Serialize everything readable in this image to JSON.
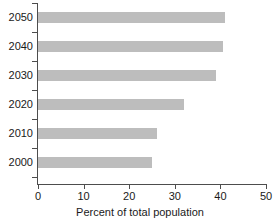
{
  "chart_data": {
    "type": "bar",
    "orientation": "horizontal",
    "title": "",
    "xlabel": "Percent of total population",
    "ylabel": "",
    "categories": [
      "2000",
      "2010",
      "2020",
      "2030",
      "2040",
      "2050"
    ],
    "values": [
      25,
      26,
      32,
      39,
      40.5,
      41
    ],
    "xlim": [
      0,
      50
    ],
    "xticks": [
      "0",
      "10",
      "20",
      "30",
      "40",
      "50"
    ],
    "xtick_values": [
      0,
      10,
      20,
      30,
      40,
      50
    ],
    "grid": false,
    "legend": null,
    "bar_color": "#bdbdbd",
    "axis_color": "#4d4d4d",
    "background": "#ffffff"
  }
}
